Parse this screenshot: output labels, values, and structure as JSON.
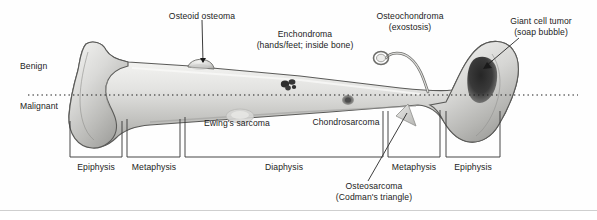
{
  "figure": {
    "background_color": "#fefefe"
  },
  "axis_labels": {
    "benign": "Benign",
    "malignant": "Malignant",
    "divider_style": "dotted",
    "divider_color": "#1a1a1a"
  },
  "tumor_labels": [
    {
      "name": "osteoid-osteoma",
      "line1": "Osteoid osteoma",
      "line2": "",
      "category": "benign"
    },
    {
      "name": "enchondroma",
      "line1": "Enchondroma",
      "line2": "(hands/feet; inside bone)",
      "category": "benign"
    },
    {
      "name": "osteochondroma",
      "line1": "Osteochondroma",
      "line2": "(exostosis)",
      "category": "benign"
    },
    {
      "name": "giant-cell-tumor",
      "line1": "Giant cell tumor",
      "line2": "(soap bubble)",
      "category": "benign"
    },
    {
      "name": "ewings-sarcoma",
      "line1": "Ewing's sarcoma",
      "line2": "",
      "category": "malignant"
    },
    {
      "name": "chondrosarcoma",
      "line1": "Chondrosarcoma",
      "line2": "",
      "category": "malignant"
    },
    {
      "name": "osteosarcoma",
      "line1": "Osteosarcoma",
      "line2": "(Codman's triangle)",
      "category": "malignant"
    }
  ],
  "regions": [
    {
      "name": "epiphysis-left",
      "label": "Epiphysis"
    },
    {
      "name": "metaphysis-left",
      "label": "Metaphysis"
    },
    {
      "name": "diaphysis",
      "label": "Diaphysis"
    },
    {
      "name": "metaphysis-right",
      "label": "Metaphysis"
    },
    {
      "name": "epiphysis-right",
      "label": "Epiphysis"
    }
  ],
  "colors": {
    "bone_fill_light": "#f2f2f0",
    "bone_fill_mid": "#c9c9c7",
    "bone_fill_dark": "#a9a9a6",
    "bone_outline": "#5a5a58",
    "lesion_dark": "#3a3a3a",
    "text": "#1c1c1c",
    "bracket": "#3d3d3d"
  }
}
